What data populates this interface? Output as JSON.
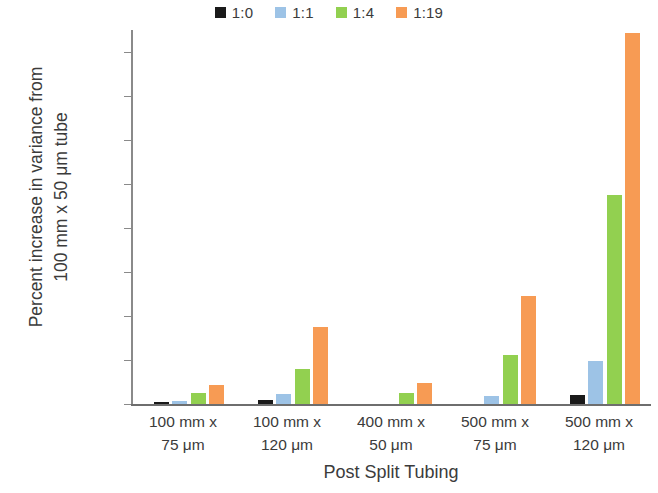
{
  "chart_data": {
    "type": "bar",
    "title": "",
    "xlabel": "Post Split Tubing",
    "ylabel_lines": [
      "Percent increase in variance from",
      "100 mm x 50 μm tube"
    ],
    "ylabel": "Percent increase in variance from 100 mm x 50 μm tube",
    "ylim": [
      0,
      1700
    ],
    "yticks": [
      0,
      200,
      400,
      600,
      800,
      1000,
      1200,
      1400,
      1600
    ],
    "ytick_labels": [
      "0",
      "200",
      "400",
      "600",
      "800",
      "1000",
      "1200",
      "1400",
      "1600"
    ],
    "grid": false,
    "legend_position": "top-center",
    "categories": [
      "100 mm x 75 μm",
      "100 mm x 120 μm",
      "400 mm x 50 μm",
      "500 mm x 75 μm",
      "500 mm x 120 μm"
    ],
    "category_lines": [
      [
        "100 mm x",
        "75 μm"
      ],
      [
        "100 mm x",
        "120 μm"
      ],
      [
        "400 mm x",
        "50 μm"
      ],
      [
        "500 mm x",
        "75 μm"
      ],
      [
        "500 mm x",
        "120 μm"
      ]
    ],
    "series": [
      {
        "name": "1:0",
        "color": "#1a1a1a",
        "values": [
          10,
          20,
          0,
          0,
          40
        ]
      },
      {
        "name": "1:1",
        "color": "#9DC3E6",
        "values": [
          15,
          45,
          0,
          35,
          195
        ]
      },
      {
        "name": "1:4",
        "color": "#92D050",
        "values": [
          48,
          160,
          50,
          225,
          950
        ]
      },
      {
        "name": "1:19",
        "color": "#F79B54",
        "values": [
          85,
          350,
          95,
          490,
          1685
        ]
      }
    ]
  },
  "legend": {
    "items": [
      {
        "label": "1:0",
        "color": "#1a1a1a"
      },
      {
        "label": "1:1",
        "color": "#9DC3E6"
      },
      {
        "label": "1:4",
        "color": "#92D050"
      },
      {
        "label": "1:19",
        "color": "#F79B54"
      }
    ]
  },
  "axis_title_x": "Post Split Tubing"
}
